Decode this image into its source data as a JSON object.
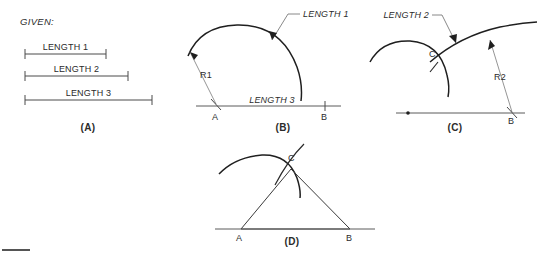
{
  "figure": {
    "title_label": "GIVEN:",
    "given": {
      "bars": [
        {
          "label": "LENGTH 1",
          "x1": 25,
          "x2": 106,
          "y": 54
        },
        {
          "label": "LENGTH 2",
          "x1": 25,
          "x2": 128,
          "y": 76
        },
        {
          "label": "LENGTH 3",
          "x1": 25,
          "x2": 152,
          "y": 100
        }
      ]
    },
    "panels": [
      {
        "id": "A",
        "label": "(A)",
        "x": 88,
        "y": 131
      },
      {
        "id": "B",
        "label": "(B)",
        "x": 283,
        "y": 131
      },
      {
        "id": "C",
        "label": "(C)",
        "x": 455,
        "y": 131
      },
      {
        "id": "D",
        "label": "(D)",
        "x": 292,
        "y": 245
      }
    ],
    "panel_b": {
      "callout_label": "LENGTH 1",
      "baseline_label": "LENGTH 3",
      "radius_label": "R1",
      "point_a": "A",
      "point_b": "B"
    },
    "panel_c": {
      "callout_label": "LENGTH 2",
      "radius_label": "R2",
      "point_c": "C",
      "point_b": "B"
    },
    "panel_d": {
      "point_a": "A",
      "point_b": "B",
      "point_c": "C"
    },
    "colors": {
      "arc": "#1f1f1f",
      "baseline": "#5a5a5a",
      "leader": "#6a6a6a",
      "text": "#2b2b2b",
      "background": "#ffffff"
    }
  }
}
